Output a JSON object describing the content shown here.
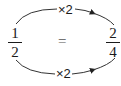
{
  "diagram": {
    "left_fraction": {
      "numerator": "1",
      "denominator": "2"
    },
    "right_fraction": {
      "numerator": "2",
      "denominator": "4"
    },
    "equals_sign": "=",
    "top_arrow": {
      "label": "×2",
      "direction": "left-to-right"
    },
    "bottom_arrow": {
      "label": "×2",
      "direction": "left-to-right"
    },
    "colors": {
      "ink": "#1a1a1a",
      "stroke": "#333333"
    }
  }
}
